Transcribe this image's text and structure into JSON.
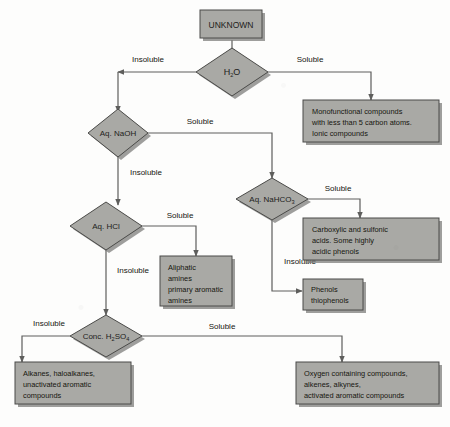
{
  "diagram": {
    "colors": {
      "node_fill": "#a9a9a5",
      "node_stroke": "#4a4a48",
      "shadow": "#7e7e7c",
      "connector": "#5e5e5c",
      "text": "#16160f"
    },
    "start": {
      "label": "UNKNOWN"
    },
    "tests": [
      {
        "id": "h2o",
        "label": "H",
        "sub": "2",
        "label_tail": "O"
      },
      {
        "id": "naoh",
        "label": "Aq. NaOH",
        "sub": "",
        "label_tail": ""
      },
      {
        "id": "nahco3",
        "label": "Aq. NaHCO",
        "sub": "3",
        "label_tail": ""
      },
      {
        "id": "hcl",
        "label": "Aq. HCl",
        "sub": "",
        "label_tail": ""
      },
      {
        "id": "h2so4",
        "label": "Conc. H",
        "sub": "2",
        "label_tail": "SO",
        "sub2": "4"
      }
    ],
    "edge_labels": {
      "h2o_insoluble": "Insoluble",
      "h2o_soluble": "Soluble",
      "naoh_soluble": "Soluble",
      "naoh_insoluble": "Insoluble",
      "nahco3_soluble": "Soluble",
      "nahco3_insoluble": "Insoluble",
      "hcl_soluble": "Soluble",
      "hcl_insoluble": "Insoluble",
      "h2so4_soluble": "Soluble",
      "h2so4_insoluble": "Insoluble"
    },
    "results": [
      {
        "id": "monofunctional",
        "lines": [
          "Monofunctional compounds",
          "with less than 5 carbon atoms.",
          "Ionic compounds"
        ]
      },
      {
        "id": "carboxylic",
        "lines": [
          "Carboxylic and sulfonic",
          "acids. Some highly",
          "acidic phenols"
        ]
      },
      {
        "id": "amines",
        "lines": [
          "Aliphatic",
          "amines",
          "primary aromatic",
          "amines"
        ]
      },
      {
        "id": "phenols",
        "lines": [
          "Phenols",
          "thiophenols"
        ]
      },
      {
        "id": "alkanes",
        "lines": [
          "Alkanes, haloalkanes,",
          "unactivated aromatic",
          "compounds"
        ]
      },
      {
        "id": "oxygen",
        "lines": [
          "Oxygen containing compounds,",
          "alkenes, alkynes,",
          "activated aromatic compounds"
        ]
      }
    ]
  }
}
